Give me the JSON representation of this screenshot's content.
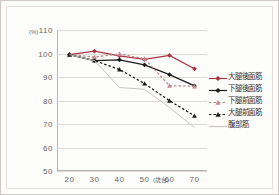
{
  "chart_data": {
    "type": "line",
    "title": "",
    "xlabel": "(歳台)",
    "ylabel": "(%)",
    "x": [
      20,
      30,
      40,
      50,
      60,
      70
    ],
    "categories": [
      "20",
      "30",
      "40",
      "50",
      "60",
      "70"
    ],
    "xlim": [
      15,
      75
    ],
    "ylim": [
      50,
      110
    ],
    "yticks": [
      110,
      100,
      90,
      80,
      70,
      60,
      50
    ],
    "xticks": [
      20,
      30,
      40,
      50,
      60,
      70
    ],
    "grid": true,
    "legend_position": "right",
    "series": [
      {
        "name": "大腿後面筋",
        "color": "#a83440",
        "marker": "diamond",
        "dash": "solid",
        "values": [
          99.5,
          101.0,
          99.0,
          97.5,
          99.2,
          93.5
        ]
      },
      {
        "name": "下腿後面筋",
        "color": "#1c1c1c",
        "marker": "diamond",
        "dash": "solid",
        "values": [
          99.5,
          97.0,
          97.3,
          95.2,
          91.0,
          86.2
        ]
      },
      {
        "name": "下腿前面筋",
        "color": "#c08a90",
        "marker": "triangle",
        "dash": "dotted",
        "values": [
          99.5,
          98.5,
          99.8,
          97.8,
          86.3,
          86.0
        ]
      },
      {
        "name": "大腿前面筋",
        "color": "#1c1c1c",
        "marker": "triangle",
        "dash": "dotted",
        "values": [
          99.5,
          97.0,
          93.2,
          87.2,
          79.9,
          73.5
        ]
      },
      {
        "name": "腹部筋",
        "color": "#c9c4c0",
        "marker": "none",
        "dash": "solid",
        "values": [
          99.5,
          97.0,
          85.5,
          84.8,
          77.0,
          68.5
        ]
      }
    ]
  }
}
